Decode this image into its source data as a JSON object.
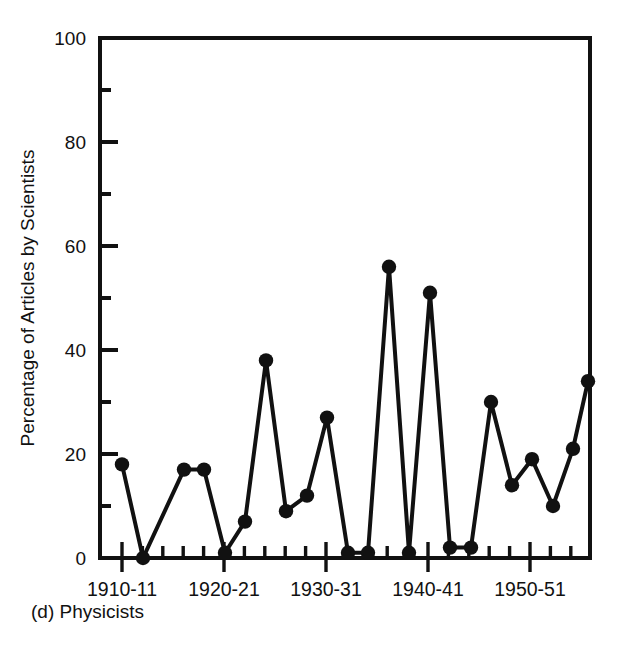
{
  "figure": {
    "caption": "(d) Physicists",
    "background_color": "#ffffff",
    "ink_color": "#111111"
  },
  "chart_data": {
    "type": "line",
    "title": "",
    "subtitle": "",
    "xlabel": "",
    "ylabel": "Percentage of Articles by Scientists",
    "ylim": [
      0,
      100
    ],
    "xlim": [
      "1908-09",
      "1956-57"
    ],
    "grid": false,
    "legend": null,
    "marker": "filled-circle",
    "y_major_ticks": [
      0,
      20,
      40,
      60,
      80,
      100
    ],
    "y_minor_ticks": [
      10,
      30,
      50,
      70,
      90
    ],
    "y_tick_labels": [
      "0",
      "20",
      "40",
      "60",
      "80",
      "100"
    ],
    "x_major_tick_labels": [
      "1910-11",
      "1920-21",
      "1930-31",
      "1940-41",
      "1950-51"
    ],
    "x_major_tick_categories": [
      "1910-11",
      "1920-21",
      "1930-31",
      "1940-41",
      "1950-51"
    ],
    "categories": [
      "1910-11",
      "1912-13",
      "1914-15",
      "1916-17",
      "1918-19",
      "1920-21",
      "1922-23",
      "1924-25",
      "1926-27",
      "1928-29",
      "1930-31",
      "1932-33",
      "1934-35",
      "1936-37",
      "1938-39",
      "1940-41",
      "1942-43",
      "1944-45",
      "1946-47",
      "1948-49",
      "1950-51",
      "1952-53",
      "1954-55",
      "1956-57"
    ],
    "values": [
      18,
      0,
      17,
      17,
      1,
      7,
      38,
      9,
      12,
      27,
      1,
      1,
      56,
      1,
      51,
      2,
      2,
      30,
      14,
      19,
      10,
      21,
      34,
      null
    ],
    "points": [
      {
        "x": "1910-11",
        "y": 18
      },
      {
        "x": "1911-12",
        "y": 0
      },
      {
        "x": "1913-14",
        "y": 17
      },
      {
        "x": "1914-15",
        "y": 17
      },
      {
        "x": "1916-17",
        "y": 1
      },
      {
        "x": "1918-19",
        "y": 7
      },
      {
        "x": "1920-21",
        "y": 38
      },
      {
        "x": "1921-22",
        "y": 9
      },
      {
        "x": "1923-24",
        "y": 12
      },
      {
        "x": "1925-26",
        "y": 27
      },
      {
        "x": "1927-28",
        "y": 1
      },
      {
        "x": "1929-30",
        "y": 1
      },
      {
        "x": "1931-32",
        "y": 56
      },
      {
        "x": "1933-34",
        "y": 1
      },
      {
        "x": "1935-36",
        "y": 51
      },
      {
        "x": "1937-38",
        "y": 2
      },
      {
        "x": "1939-40",
        "y": 2
      },
      {
        "x": "1941-42",
        "y": 30
      },
      {
        "x": "1943-44",
        "y": 14
      },
      {
        "x": "1945-46",
        "y": 19
      },
      {
        "x": "1947-48",
        "y": 10
      },
      {
        "x": "1949-50",
        "y": 21
      },
      {
        "x": "1951-52",
        "y": 34
      }
    ],
    "pixel_points": [
      {
        "px": 122,
        "v": 18
      },
      {
        "px": 143,
        "v": 0
      },
      {
        "px": 184,
        "v": 17
      },
      {
        "px": 204,
        "v": 17
      },
      {
        "px": 225,
        "v": 1
      },
      {
        "px": 245,
        "v": 7
      },
      {
        "px": 266,
        "v": 38
      },
      {
        "px": 286,
        "v": 9
      },
      {
        "px": 307,
        "v": 12
      },
      {
        "px": 327,
        "v": 27
      },
      {
        "px": 348,
        "v": 1
      },
      {
        "px": 368,
        "v": 1
      },
      {
        "px": 389,
        "v": 56
      },
      {
        "px": 409,
        "v": 1
      },
      {
        "px": 430,
        "v": 51
      },
      {
        "px": 450,
        "v": 2
      },
      {
        "px": 471,
        "v": 2
      },
      {
        "px": 491,
        "v": 30
      },
      {
        "px": 512,
        "v": 14
      },
      {
        "px": 532,
        "v": 19
      },
      {
        "px": 553,
        "v": 10
      },
      {
        "px": 573,
        "v": 21
      },
      {
        "px": 588,
        "v": 34
      }
    ]
  }
}
